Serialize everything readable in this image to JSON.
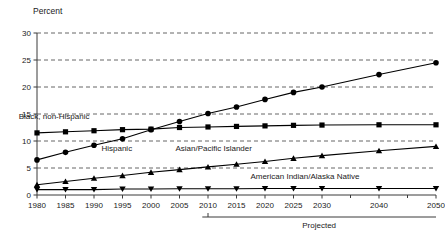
{
  "chart_data": {
    "type": "line",
    "title": "",
    "ylabel": "Percent",
    "xlabel": "",
    "ylim": [
      0,
      30
    ],
    "yticks": [
      0,
      5,
      10,
      15,
      20,
      25,
      30
    ],
    "ytick_labels": [
      "0",
      "5",
      "10",
      "15",
      "20",
      "25",
      "30"
    ],
    "grid": "horizontal-dashed",
    "legend": "inline-series-labels",
    "x": [
      1980,
      1985,
      1990,
      1995,
      2000,
      2005,
      2010,
      2015,
      2020,
      2025,
      2030,
      2040,
      2050
    ],
    "xtick_labels": [
      "1980",
      "1985",
      "1990",
      "1995",
      "2000",
      "2005",
      "2010",
      "2015",
      "2020",
      "2025",
      "2030",
      "2040",
      "2050"
    ],
    "minor_xticks": [
      2035,
      2045
    ],
    "series": [
      {
        "name": "Black, non-Hispanic",
        "marker": "square",
        "label_x": 1983,
        "label_y": 14.0,
        "values": [
          11.5,
          11.7,
          11.9,
          12.1,
          12.2,
          12.5,
          12.6,
          12.7,
          12.8,
          12.9,
          12.95,
          13.0,
          13.0
        ]
      },
      {
        "name": "Hispanic",
        "marker": "circle",
        "label_x": 1994,
        "label_y": 8.2,
        "values": [
          6.5,
          7.9,
          9.2,
          10.4,
          12.1,
          13.6,
          15.1,
          16.3,
          17.7,
          19.0,
          20.0,
          22.3,
          24.5
        ]
      },
      {
        "name": "Asian/Pacific Islander",
        "marker": "triangle-up",
        "label_x": 2011,
        "label_y": 8.2,
        "values": [
          1.9,
          2.5,
          3.1,
          3.6,
          4.2,
          4.7,
          5.2,
          5.7,
          6.2,
          6.8,
          7.3,
          8.2,
          9.0
        ]
      },
      {
        "name": "American Indian/Alaska Native",
        "marker": "triangle-down",
        "label_x": 2027,
        "label_y": 3.0,
        "values": [
          1.0,
          1.0,
          1.0,
          1.1,
          1.1,
          1.15,
          1.15,
          1.15,
          1.2,
          1.2,
          1.2,
          1.2,
          1.2
        ]
      }
    ],
    "annotations": [
      {
        "text": "Projected",
        "start_x": 2009,
        "end_x": 2050,
        "tick_x": 2010
      }
    ],
    "colors": {
      "line": "#000000",
      "grid": "#555555",
      "axis": "#3a3a3a",
      "text": "#1a1a1a",
      "background": "#ffffff"
    }
  }
}
